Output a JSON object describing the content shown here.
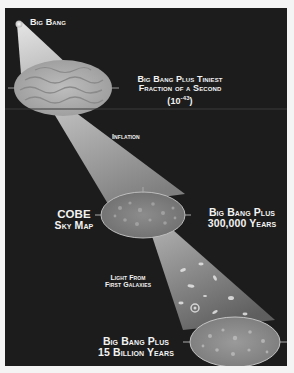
{
  "diagram": {
    "colors": {
      "background": "#1c1c1c",
      "page": "#f4f4f4",
      "text": "#f2f2f2",
      "beam": "#d8d8d8",
      "ellipse_fill": "#a8a8a8"
    },
    "stages": [
      {
        "id": "big-bang",
        "label": "Big Bang"
      },
      {
        "id": "tiniest-fraction",
        "label_line1": "Big Bang Plus Tiniest",
        "label_line2": "Fraction of a Second",
        "label_line3_base": "(10",
        "label_line3_exp": "-43",
        "label_line3_end": ")"
      },
      {
        "id": "cobe",
        "label_line1": "Big Bang Plus",
        "label_line2": "300,000 Years",
        "side_label_line1": "COBE",
        "side_label_line2": "Sky Map"
      },
      {
        "id": "fifteen-billion",
        "label_line1": "Big Bang Plus",
        "label_line2": "15 Billion Years"
      }
    ],
    "transitions": [
      {
        "id": "inflation",
        "label": "Inflation"
      },
      {
        "id": "first-galaxies",
        "label_line1": "Light From",
        "label_line2": "First Galaxies"
      }
    ]
  }
}
